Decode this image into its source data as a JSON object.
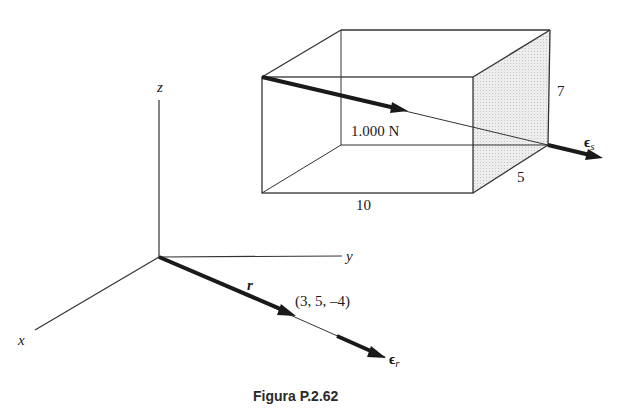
{
  "figure": {
    "caption": "Figura P.2.62",
    "axes": {
      "x_label": "x",
      "y_label": "y",
      "z_label": "z"
    },
    "box": {
      "dimensions": {
        "length": "10",
        "depth": "5",
        "height": "7"
      },
      "force_label": "1.000 N",
      "unit_vector_label": "ϵ",
      "unit_vector_sub": "s"
    },
    "position_vector": {
      "label": "r",
      "point_label": "(3, 5, –4)",
      "unit_vector_label": "ϵ",
      "unit_vector_sub": "r"
    },
    "colors": {
      "line": "#333333",
      "shade": "#e4e4e4",
      "arrow": "#1a1a1a"
    }
  }
}
